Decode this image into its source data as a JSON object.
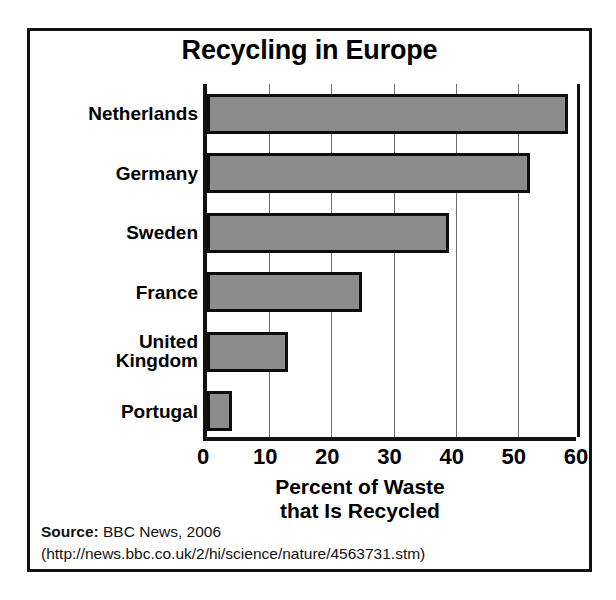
{
  "chart_data": {
    "type": "bar",
    "orientation": "horizontal",
    "title": "Recycling in Europe",
    "categories": [
      "Netherlands",
      "Germany",
      "Sweden",
      "France",
      "United Kingdom",
      "Portugal"
    ],
    "values": [
      58,
      52,
      39,
      25,
      13,
      4
    ],
    "xlabel": "Percent of Waste that Is Recycled",
    "xlabel_line1": "Percent of Waste",
    "xlabel_line2": "that Is Recycled",
    "ylabel": "",
    "xlim": [
      0,
      60
    ],
    "xticks": [
      0,
      10,
      20,
      30,
      40,
      50,
      60
    ],
    "xtick_labels": [
      "0",
      "10",
      "20",
      "30",
      "40",
      "50",
      "60"
    ],
    "grid": "vertical",
    "legend": "none",
    "bar_fill_color": "#8c8c8c",
    "bar_edge_color": "#0d0d0d",
    "frame_color": "#111111",
    "background_color": "#ffffff"
  },
  "labels": {
    "netherlands": "Netherlands",
    "germany": "Germany",
    "sweden": "Sweden",
    "france": "France",
    "united_kingdom": "United\nKingdom",
    "portugal": "Portugal"
  },
  "source": {
    "lead": "Source:",
    "text": " BBC News, 2006",
    "url_line": "(http://news.bbc.co.uk/2/hi/science/nature/4563731.stm)"
  }
}
